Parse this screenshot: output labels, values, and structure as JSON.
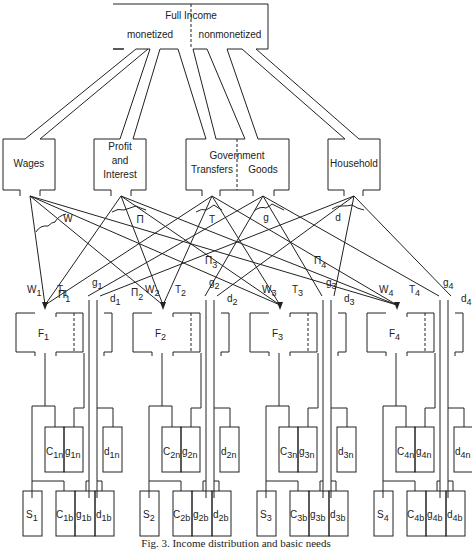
{
  "top_box": {
    "title": "Full Income",
    "left": "monetized",
    "right": "nonmonetized"
  },
  "sources": [
    {
      "id": "wages",
      "lines": [
        "Wages"
      ],
      "flow_label": "W"
    },
    {
      "id": "profit",
      "lines": [
        "Profit",
        "and",
        "Interest"
      ],
      "flow_label": "Π"
    },
    {
      "id": "government",
      "lines": [
        "Government"
      ],
      "left": "Transfers",
      "right": "Goods",
      "flow_labels": [
        "T",
        "g"
      ]
    },
    {
      "id": "household",
      "lines": [
        "Household"
      ],
      "flow_label": "d"
    }
  ],
  "pi_labels": [
    {
      "base": "Π",
      "sub": "1"
    },
    {
      "base": "Π",
      "sub": "2"
    },
    {
      "base": "Π",
      "sub": "3"
    },
    {
      "base": "Π",
      "sub": "4"
    }
  ],
  "groups": [
    {
      "n": "1",
      "F": "F",
      "W": "W",
      "T": "T",
      "g": "g",
      "d": "d",
      "C_n": "C",
      "g_n": "g",
      "d_n": "d",
      "S": "S",
      "C_b": "C",
      "g_b": "g",
      "d_b": "d",
      "sub_n": "1n",
      "sub_b": "1b"
    },
    {
      "n": "2",
      "F": "F",
      "W": "W",
      "T": "T",
      "g": "g",
      "d": "d",
      "C_n": "C",
      "g_n": "g",
      "d_n": "d",
      "S": "S",
      "C_b": "C",
      "g_b": "g",
      "d_b": "d",
      "sub_n": "2n",
      "sub_b": "2b"
    },
    {
      "n": "3",
      "F": "F",
      "W": "W",
      "T": "T",
      "g": "g",
      "d": "d",
      "C_n": "C",
      "g_n": "g",
      "d_n": "d",
      "S": "S",
      "C_b": "C",
      "g_b": "g",
      "d_b": "d",
      "sub_n": "3n",
      "sub_b": "3b"
    },
    {
      "n": "4",
      "F": "F",
      "W": "W",
      "T": "T",
      "g": "g",
      "d": "d",
      "C_n": "C",
      "g_n": "g",
      "d_n": "d",
      "S": "S",
      "C_b": "C",
      "g_b": "g",
      "d_b": "d",
      "sub_n": "4n",
      "sub_b": "4b"
    }
  ],
  "caption": "Fig. 3.   Income distribution and basic needs"
}
